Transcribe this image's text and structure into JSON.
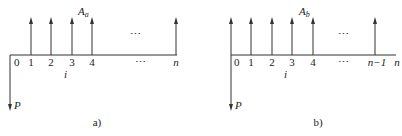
{
  "diagrams": [
    {
      "id": "a",
      "caption": "a)",
      "annuity_label": "A",
      "annuity_sub": "a",
      "rate_label": "i",
      "present_label": "P",
      "ellipsis_top": "⋯",
      "ellipsis_axis": "⋯",
      "ticks": [
        "0",
        "1",
        "2",
        "3",
        "4",
        "n"
      ],
      "arrows_up_at": [
        "1",
        "2",
        "3",
        "4",
        "n"
      ]
    },
    {
      "id": "b",
      "caption": "b)",
      "annuity_label": "A",
      "annuity_sub": "b",
      "rate_label": "i",
      "present_label": "P",
      "ellipsis_top": "⋯",
      "ellipsis_axis": "⋯",
      "ticks": [
        "0",
        "1",
        "2",
        "3",
        "4",
        "n−1",
        "n"
      ],
      "arrows_up_at": [
        "0",
        "1",
        "2",
        "3",
        "4",
        "n−1"
      ]
    }
  ]
}
